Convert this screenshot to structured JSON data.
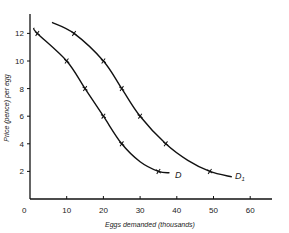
{
  "chart_data": {
    "type": "line",
    "title": "",
    "xlabel": "Eggs demanded (thousands)",
    "ylabel": "Price (pence) per egg",
    "xlim": [
      0,
      65
    ],
    "ylim": [
      0,
      13
    ],
    "x_ticks": [
      0,
      10,
      20,
      30,
      40,
      50,
      60
    ],
    "y_ticks": [
      2,
      4,
      6,
      8,
      10,
      12
    ],
    "grid": false,
    "legend": "none (curves labelled at their ends)",
    "series": [
      {
        "name": "D",
        "marked_points": [
          [
            2,
            12
          ],
          [
            10,
            10
          ],
          [
            15,
            8
          ],
          [
            20,
            6
          ],
          [
            25,
            4
          ],
          [
            35,
            2
          ]
        ],
        "curve": [
          [
            1,
            12.4
          ],
          [
            2,
            12
          ],
          [
            10,
            10
          ],
          [
            15,
            8
          ],
          [
            20,
            6
          ],
          [
            25,
            4
          ],
          [
            30,
            2.7
          ],
          [
            35,
            2
          ],
          [
            38,
            1.9
          ]
        ]
      },
      {
        "name": "D1",
        "marked_points": [
          [
            12,
            12
          ],
          [
            20,
            10
          ],
          [
            25,
            8
          ],
          [
            30,
            6
          ],
          [
            37,
            4
          ],
          [
            49,
            2
          ]
        ],
        "curve": [
          [
            6,
            12.8
          ],
          [
            12,
            12
          ],
          [
            20,
            10
          ],
          [
            25,
            8
          ],
          [
            30,
            6
          ],
          [
            37,
            4
          ],
          [
            43,
            2.8
          ],
          [
            49,
            2
          ],
          [
            55,
            1.6
          ]
        ]
      }
    ]
  },
  "labels": {
    "origin": "0",
    "curve_d": "D",
    "curve_d1_main": "D",
    "curve_d1_sub": "1"
  }
}
